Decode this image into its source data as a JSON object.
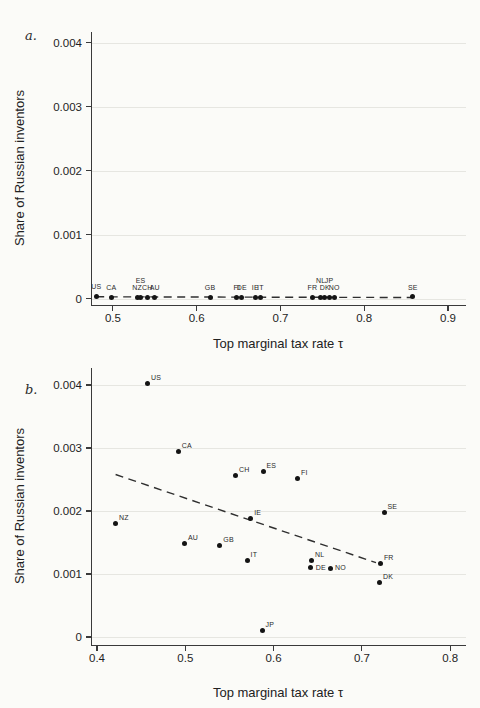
{
  "colors": {
    "background": "#fbfbf8",
    "dot": "#141414",
    "axis": "#3a3a3a",
    "gridline": "#e6e6e1",
    "trend_line": "#2f2f2f"
  },
  "chart_data": [
    {
      "type": "scatter",
      "panel_label": "a.",
      "xlabel": "Top marginal tax rate τ",
      "ylabel": "Share of Russian inventors",
      "xlim": [
        0.475,
        0.9215
      ],
      "ylim": [
        -0.0001,
        0.00417
      ],
      "x_ticks": [
        0.5,
        0.6,
        0.7,
        0.8,
        0.9
      ],
      "x_tick_labels": [
        "0.5",
        "0.6",
        "0.7",
        "0.8",
        "0.9"
      ],
      "y_ticks": [
        0,
        0.001,
        0.002,
        0.003,
        0.004
      ],
      "y_tick_labels": [
        "0",
        "0.001",
        "0.002",
        "0.003",
        "0.004"
      ],
      "grid": "horizontal",
      "legend": "none",
      "default_label_pos": "above",
      "points": [
        {
          "label": "US",
          "x": 0.48,
          "y": 4e-05
        },
        {
          "label": "CA",
          "x": 0.498,
          "y": 2e-05
        },
        {
          "label": "NZ",
          "x": 0.529,
          "y": 2e-05
        },
        {
          "label": "ES",
          "x": 0.533,
          "y": 2e-05,
          "lp": "above-high"
        },
        {
          "label": "CH",
          "x": 0.541,
          "y": 2e-05
        },
        {
          "label": "AU",
          "x": 0.55,
          "y": 2e-05
        },
        {
          "label": "GB",
          "x": 0.616,
          "y": 2e-05
        },
        {
          "label": "FI",
          "x": 0.648,
          "y": 2e-05
        },
        {
          "label": "DE",
          "x": 0.654,
          "y": 2e-05
        },
        {
          "label": "IE",
          "x": 0.67,
          "y": 2e-05
        },
        {
          "label": "IT",
          "x": 0.676,
          "y": 2e-05
        },
        {
          "label": "FR",
          "x": 0.738,
          "y": 2e-05
        },
        {
          "label": "NL",
          "x": 0.748,
          "y": 2e-05,
          "lp": "above-high"
        },
        {
          "label": "DK",
          "x": 0.753,
          "y": 2e-05
        },
        {
          "label": "JP",
          "x": 0.758,
          "y": 2e-05,
          "lp": "above-high"
        },
        {
          "label": "NO",
          "x": 0.764,
          "y": 2e-05
        },
        {
          "label": "SE",
          "x": 0.858,
          "y": 3e-05
        }
      ],
      "trend_line": {
        "style": "dashed",
        "x1": 0.48,
        "y1": 2.8e-05,
        "x2": 0.858,
        "y2": 1.8e-05
      }
    },
    {
      "type": "scatter",
      "panel_label": "b.",
      "xlabel": "Top marginal tax rate τ",
      "ylabel": "Share of Russian inventors",
      "xlim": [
        0.3943,
        0.8179
      ],
      "ylim": [
        -0.000127,
        0.00427
      ],
      "x_ticks": [
        0.4,
        0.5,
        0.6,
        0.7,
        0.8
      ],
      "x_tick_labels": [
        "0.4",
        "0.5",
        "0.6",
        "0.7",
        "0.8"
      ],
      "y_ticks": [
        0,
        0.001,
        0.002,
        0.003,
        0.004
      ],
      "y_tick_labels": [
        "0",
        "0.001",
        "0.002",
        "0.003",
        "0.004"
      ],
      "grid": "horizontal",
      "legend": "none",
      "default_label_pos": "above-right",
      "points": [
        {
          "label": "US",
          "x": 0.457,
          "y": 0.00403
        },
        {
          "label": "CA",
          "x": 0.492,
          "y": 0.00295
        },
        {
          "label": "CH",
          "x": 0.557,
          "y": 0.00256
        },
        {
          "label": "ES",
          "x": 0.588,
          "y": 0.00263
        },
        {
          "label": "FI",
          "x": 0.627,
          "y": 0.00251
        },
        {
          "label": "SE",
          "x": 0.725,
          "y": 0.00197
        },
        {
          "label": "NZ",
          "x": 0.421,
          "y": 0.0018
        },
        {
          "label": "IE",
          "x": 0.574,
          "y": 0.00188
        },
        {
          "label": "AU",
          "x": 0.499,
          "y": 0.00148
        },
        {
          "label": "GB",
          "x": 0.539,
          "y": 0.00146
        },
        {
          "label": "IT",
          "x": 0.57,
          "y": 0.00122
        },
        {
          "label": "NL",
          "x": 0.643,
          "y": 0.00122
        },
        {
          "label": "DE",
          "x": 0.642,
          "y": 0.0011,
          "lp": "right"
        },
        {
          "label": "NO",
          "x": 0.664,
          "y": 0.00109,
          "lp": "right"
        },
        {
          "label": "FR",
          "x": 0.721,
          "y": 0.00117
        },
        {
          "label": "DK",
          "x": 0.72,
          "y": 0.00086
        },
        {
          "label": "JP",
          "x": 0.587,
          "y": 0.0001
        }
      ],
      "trend_line": {
        "style": "dashed",
        "x1": 0.421,
        "y1": 0.00258,
        "x2": 0.716,
        "y2": 0.00118
      }
    }
  ]
}
